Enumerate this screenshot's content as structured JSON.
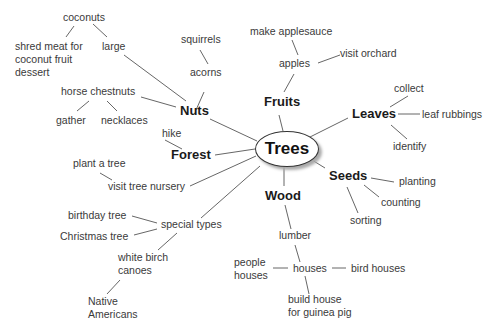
{
  "diagram": {
    "type": "concept web",
    "center": "Trees",
    "branches": [
      {
        "label": "Fruits",
        "children": [
          {
            "label": "apples",
            "children": [
              "make applesauce",
              "visit orchard"
            ]
          }
        ]
      },
      {
        "label": "Leaves",
        "children": [
          "collect",
          "leaf rubbings",
          "identify"
        ]
      },
      {
        "label": "Seeds",
        "children": [
          "planting",
          "counting",
          "sorting"
        ]
      },
      {
        "label": "Wood",
        "children": [
          {
            "label": "lumber",
            "children": [
              {
                "label": "houses",
                "children": [
                  "people houses",
                  "bird houses",
                  "build house for guinea pig"
                ]
              }
            ]
          }
        ]
      },
      {
        "label": "special types",
        "children": [
          "birthday tree",
          "Christmas tree",
          {
            "label": "white birch canoes",
            "children": [
              "Native Americans"
            ]
          }
        ]
      },
      {
        "label": "visit tree nursery",
        "children": [
          "plant a tree"
        ]
      },
      {
        "label": "Forest",
        "children": [
          "hike"
        ]
      },
      {
        "label": "Nuts",
        "children": [
          {
            "label": "acorns",
            "children": [
              "squirrels"
            ]
          },
          {
            "label": "horse chestnuts",
            "children": [
              "gather",
              "necklaces"
            ]
          },
          {
            "label": "large",
            "children": [
              {
                "label": "coconuts",
                "children": [
                  "shred meat for coconut fruit dessert"
                ]
              }
            ]
          }
        ]
      }
    ]
  },
  "nodes": {
    "trees": "Trees",
    "fruits": "Fruits",
    "apples": "apples",
    "make_applesauce": "make applesauce",
    "visit_orchard": "visit orchard",
    "leaves": "Leaves",
    "collect": "collect",
    "leaf_rubbings": "leaf rubbings",
    "identify": "identify",
    "seeds": "Seeds",
    "planting": "planting",
    "counting": "counting",
    "sorting": "sorting",
    "wood": "Wood",
    "lumber": "lumber",
    "houses": "houses",
    "people_houses_1": "people",
    "people_houses_2": "houses",
    "bird_houses": "bird houses",
    "guinea_1": "build house",
    "guinea_2": "for guinea pig",
    "special_types": "special types",
    "birthday_tree": "birthday tree",
    "christmas_tree": "Christmas tree",
    "canoes_1": "white birch",
    "canoes_2": "canoes",
    "native_1": "Native",
    "native_2": "Americans",
    "nursery": "visit tree nursery",
    "plant_tree": "plant a tree",
    "forest": "Forest",
    "hike": "hike",
    "nuts": "Nuts",
    "acorns": "acorns",
    "squirrels": "squirrels",
    "horse_chestnuts": "horse chestnuts",
    "gather": "gather",
    "necklaces": "necklaces",
    "large": "large",
    "coconuts": "coconuts",
    "shred_1": "shred meat for",
    "shred_2": "coconut fruit",
    "shred_3": "dessert"
  }
}
